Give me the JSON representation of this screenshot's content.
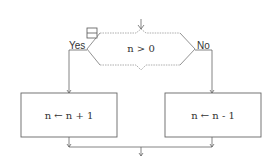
{
  "diagram": {
    "type": "flowchart",
    "decision": {
      "condition": "n > 0"
    },
    "branches": {
      "yes_label": "Yes",
      "no_label": "No"
    },
    "processes": {
      "yes_action": "n ← n + 1",
      "no_action": "n ← n - 1"
    },
    "colors": {
      "stroke": "#555555",
      "dotted": "#999999",
      "text": "#333333"
    }
  }
}
